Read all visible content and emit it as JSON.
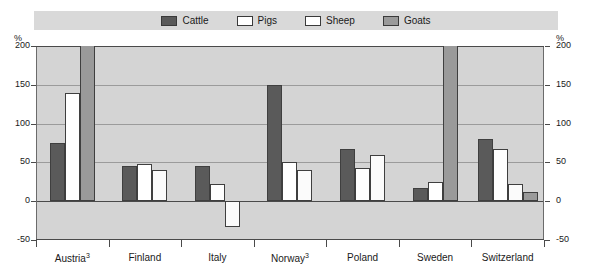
{
  "chart_data": {
    "type": "bar",
    "title": "",
    "subtitle": "",
    "xlabel": "",
    "ylabel": "%",
    "ylabel_right": "%",
    "ylim": [
      -50,
      200
    ],
    "yticks": [
      200,
      150,
      100,
      50,
      0,
      -50
    ],
    "grid": true,
    "legend_position": "top",
    "clipped_note": "Goats bars for Austria and Sweden exceed the 200% axis maximum and are clipped at the top of the plot.",
    "categories": [
      "Austria",
      "Finland",
      "Italy",
      "Norway",
      "Poland",
      "Sweden",
      "Switzerland"
    ],
    "category_labels": [
      "Austria³",
      "Finland",
      "Italy",
      "Norway³",
      "Poland",
      "Sweden",
      "Switzerland"
    ],
    "category_footnotes": [
      "3",
      "",
      "",
      "3",
      "",
      "",
      ""
    ],
    "series": [
      {
        "name": "Cattle",
        "color": "#5a5a5a",
        "values": [
          75,
          45,
          45,
          150,
          67,
          17,
          80
        ]
      },
      {
        "name": "Pigs",
        "color": "#ffffff",
        "values": [
          140,
          48,
          22,
          50,
          43,
          25,
          67
        ]
      },
      {
        "name": "Sheep",
        "color": "#fbfbfb",
        "values": [
          null,
          40,
          -33,
          40,
          60,
          null,
          22
        ]
      },
      {
        "name": "Goats",
        "color": "#9a9a9a",
        "values": [
          210,
          null,
          null,
          null,
          null,
          210,
          12
        ]
      }
    ]
  },
  "legend": {
    "items": [
      {
        "label": "Cattle",
        "color": "#5a5a5a"
      },
      {
        "label": "Pigs",
        "color": "#ffffff"
      },
      {
        "label": "Sheep",
        "color": "#ffffff"
      },
      {
        "label": "Goats",
        "color": "#9a9a9a"
      }
    ]
  },
  "axes": {
    "left_unit": "%",
    "right_unit": "%",
    "tick_labels": [
      "200",
      "150",
      "100",
      "50",
      "0",
      "-50"
    ]
  }
}
